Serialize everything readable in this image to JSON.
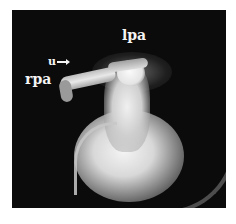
{
  "figure": {
    "labels": {
      "lpa": "lpa",
      "rpa": "rpa",
      "u": "u"
    }
  }
}
